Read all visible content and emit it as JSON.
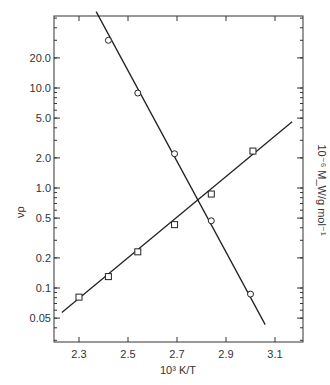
{
  "chart_data": {
    "type": "scatter",
    "title": "",
    "xlabel": "10³ K/T",
    "ylabel": "νρ",
    "y2label": "10⁻⁶ M_W/g mol⁻¹",
    "xlim": [
      2.2,
      3.21
    ],
    "ylim": [
      0.03,
      50
    ],
    "yscale": "log",
    "grid": false,
    "legend": null,
    "x_ticks": [
      "2.3",
      "2.5",
      "2.7",
      "2.9",
      "3.1"
    ],
    "x_tick_values": [
      2.3,
      2.5,
      2.7,
      2.9,
      3.1
    ],
    "y_ticks": [
      "0.05",
      "0.1",
      "0.2",
      "0.5",
      "1.0",
      "2.0",
      "5.0",
      "10.0",
      "20.0"
    ],
    "y_tick_values": [
      0.05,
      0.1,
      0.2,
      0.5,
      1.0,
      2.0,
      5.0,
      10.0,
      20.0
    ],
    "series": [
      {
        "name": "νρ (circles)",
        "marker": "circle",
        "axis": "left",
        "x": [
          2.42,
          2.54,
          2.69,
          2.84,
          3.0
        ],
        "values": [
          30,
          8.9,
          2.2,
          0.47,
          0.087
        ],
        "fit_line": {
          "x": [
            2.37,
            3.06
          ],
          "y": [
            58,
            0.043
          ]
        }
      },
      {
        "name": "10⁻⁶ M_W (squares)",
        "marker": "square",
        "axis": "right",
        "x": [
          2.3,
          2.42,
          2.54,
          2.69,
          2.84,
          3.01
        ],
        "values": [
          0.081,
          0.13,
          0.23,
          0.43,
          0.87,
          2.34
        ],
        "fit_line": {
          "x": [
            2.23,
            3.17
          ],
          "y": [
            0.057,
            4.6
          ]
        }
      }
    ]
  }
}
